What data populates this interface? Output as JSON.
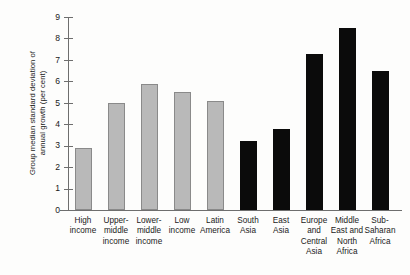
{
  "chart_data": {
    "type": "bar",
    "title": "",
    "xlabel": "",
    "ylabel": "Group median standard deviation of annual growth (per cent)",
    "ylabel_lines": [
      "Group median standard deviation of",
      "annual growth (per cent)"
    ],
    "ylim": [
      0,
      9
    ],
    "ytick_labels": [
      "9",
      "8",
      "7",
      "6",
      "5",
      "4",
      "3",
      "2",
      "1",
      "0"
    ],
    "ytick_values": [
      9,
      8,
      7,
      6,
      5,
      4,
      3,
      2,
      1,
      0
    ],
    "grid": false,
    "legend": "none",
    "categories": [
      "High income",
      "Upper-middle income",
      "Lower-middle income",
      "Low income",
      "Latin America",
      "South Asia",
      "East Asia",
      "Europe and Central Asia",
      "Middle East and North Africa",
      "Sub-Saharan Africa"
    ],
    "category_label_lines": [
      [
        "High",
        "income"
      ],
      [
        "Upper-",
        "middle",
        "income"
      ],
      [
        "Lower-",
        "middle",
        "income"
      ],
      [
        "Low",
        "income"
      ],
      [
        "Latin",
        "America"
      ],
      [
        "South",
        "Asia"
      ],
      [
        "East",
        "Asia"
      ],
      [
        "Europe",
        "and",
        "Central",
        "Asia"
      ],
      [
        "Middle",
        "East and",
        "North",
        "Africa"
      ],
      [
        "Sub-",
        "Saharan",
        "Africa"
      ]
    ],
    "values": [
      2.9,
      5.0,
      5.9,
      5.5,
      5.1,
      3.2,
      3.8,
      7.3,
      8.5,
      6.5
    ],
    "bar_colors": [
      "#b9b9b9",
      "#b9b9b9",
      "#b9b9b9",
      "#b9b9b9",
      "#b9b9b9",
      "#0b0b0b",
      "#0b0b0b",
      "#0b0b0b",
      "#0b0b0b",
      "#0b0b0b"
    ],
    "series_groups": [
      {
        "name": "Income groups",
        "color": "#b9b9b9",
        "indices": [
          0,
          1,
          2,
          3,
          4
        ]
      },
      {
        "name": "Regions",
        "color": "#0b0b0b",
        "indices": [
          5,
          6,
          7,
          8,
          9
        ]
      }
    ]
  },
  "colors": {
    "background": "#fdfdfc",
    "axis": "#6e6e6e",
    "text": "#1a1a1a",
    "light_bar": "#b9b9b9",
    "light_bar_edge": "#8a8a8a",
    "dark_bar": "#0b0b0b"
  }
}
